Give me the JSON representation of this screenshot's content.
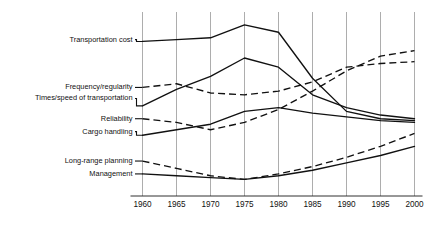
{
  "chart_data": {
    "type": "line",
    "title": "",
    "subtitle": "",
    "xlabel": "",
    "ylabel": "",
    "grid": "vertical",
    "legend_position": "left-inline-labels",
    "x": [
      1960,
      1965,
      1970,
      1975,
      1980,
      1985,
      1990,
      1995,
      2000
    ],
    "xlim": [
      1960,
      2000
    ],
    "xticks": [
      "1960",
      "1965",
      "1970",
      "1975",
      "1980",
      "1985",
      "1990",
      "1995",
      "2000"
    ],
    "ylim": [
      0,
      100
    ],
    "yticks": [],
    "note": "Vertical axis is an unlabeled ranking/importance scale; higher is more important.",
    "series": [
      {
        "name": "Transportation cost",
        "style": "solid",
        "label_y": 85,
        "values": [
          84,
          85,
          86,
          93,
          89,
          64,
          46,
          42,
          41
        ]
      },
      {
        "name": "Frequency/regularity",
        "style": "dashed",
        "label_y": 59,
        "values": [
          59,
          61,
          56,
          55,
          57,
          62,
          70,
          72,
          73
        ]
      },
      {
        "name": "Times/speed of transportation",
        "style": "solid",
        "label_y": 53,
        "values": [
          49,
          58,
          65,
          75,
          70,
          55,
          48,
          44,
          42
        ]
      },
      {
        "name": "Reliability",
        "style": "dashed",
        "label_y": 42,
        "values": [
          42,
          40,
          36,
          40,
          47,
          57,
          68,
          76,
          79
        ]
      },
      {
        "name": "Cargo handling",
        "style": "solid",
        "label_y": 35,
        "values": [
          33,
          36,
          39,
          46,
          48,
          45,
          43,
          41,
          40
        ]
      },
      {
        "name": "Long-range planning",
        "style": "dashed",
        "label_y": 19,
        "values": [
          19,
          15,
          11,
          9,
          12,
          16,
          21,
          27,
          34
        ]
      },
      {
        "name": "Management",
        "style": "solid",
        "label_y": 12,
        "values": [
          12,
          11,
          10,
          9,
          11,
          14,
          18,
          22,
          27
        ]
      }
    ]
  }
}
